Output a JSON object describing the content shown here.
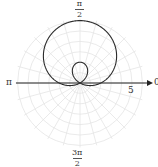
{
  "chart_data": {
    "type": "line",
    "subtype": "polar",
    "title": "",
    "equation": "r = 2 + 4 sin(θ)",
    "curve": {
      "a": 2,
      "b": 4,
      "function": "sin"
    },
    "angle_labels": {
      "right": "0",
      "top": {
        "num": "π",
        "den": "2"
      },
      "left": "π",
      "bottom": {
        "num": "3π",
        "den": "2"
      }
    },
    "radial_tick_label": "5",
    "radial_tick_value": 5,
    "grid": {
      "circles": [
        1,
        2,
        3,
        4,
        5,
        6
      ],
      "spokes_deg": 15,
      "visible": true
    },
    "rlim": [
      0,
      6.2
    ],
    "colors": {
      "curve": "#2b2b2b",
      "axis": "#222222",
      "grid": "#e4e4e4"
    }
  }
}
